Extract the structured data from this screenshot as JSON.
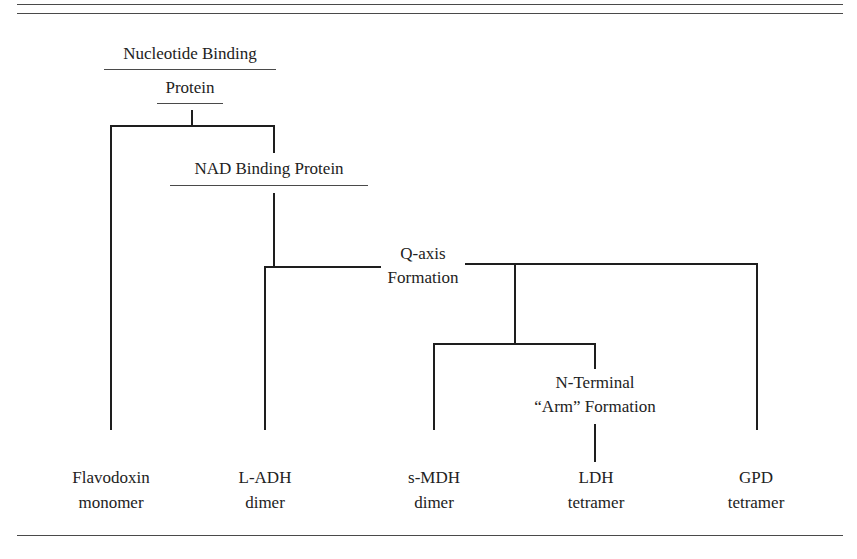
{
  "diagram": {
    "root": {
      "line1": "Nucleotide Binding",
      "line2": "Protein"
    },
    "nad": {
      "label": "NAD Binding Protein"
    },
    "qaxis": {
      "line1": "Q-axis",
      "line2": "Formation"
    },
    "nterm": {
      "line1": "N-Terminal",
      "line2": "“Arm” Formation"
    },
    "leaves": [
      {
        "name": "Flavodoxin",
        "state": "monomer"
      },
      {
        "name": "L-ADH",
        "state": "dimer"
      },
      {
        "name": "s-MDH",
        "state": "dimer"
      },
      {
        "name": "LDH",
        "state": "tetramer"
      },
      {
        "name": "GPD",
        "state": "tetramer"
      }
    ]
  }
}
